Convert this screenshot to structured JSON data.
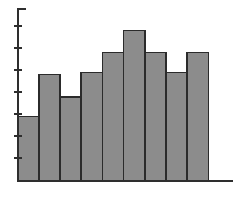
{
  "chart_data": {
    "type": "bar",
    "title": "",
    "subtitle": "",
    "xlabel": "",
    "ylabel": "",
    "categories": [
      "1",
      "2",
      "3",
      "4",
      "5",
      "6",
      "7",
      "8",
      "9"
    ],
    "values": [
      2.9,
      4.8,
      3.8,
      4.9,
      5.8,
      6.8,
      5.8,
      4.9,
      5.8
    ],
    "series": [
      {
        "name": "frequency",
        "values": [
          2.9,
          4.8,
          3.8,
          4.9,
          5.8,
          6.8,
          5.8,
          4.9,
          5.8
        ]
      }
    ],
    "ylim": [
      0,
      7.8
    ],
    "xlim": [
      0,
      10.2
    ],
    "y_ticks": [
      1,
      2,
      3,
      4,
      5,
      6,
      7
    ],
    "y_tick_labels": [
      "",
      "",
      "",
      "",
      "",
      "",
      ""
    ],
    "x_ticks": [],
    "x_tick_labels": [],
    "grid": false,
    "legend": false,
    "legend_position": "none",
    "annotations": [],
    "bar_fill_color": "#8c8c8c",
    "bar_edge_color": "#2b2b2b",
    "axis_color": "#2e2e2e",
    "background_color": "#ffffff"
  },
  "figure": {
    "name": "histogram-figure"
  },
  "axes": {
    "y_axis_name": "y-axis",
    "x_axis_name": "x-axis"
  }
}
